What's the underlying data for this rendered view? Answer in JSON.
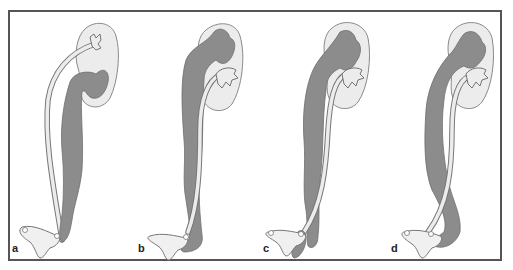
{
  "figure": {
    "type": "anatomical-diagram",
    "colors": {
      "frame": "#555555",
      "kidney_fill": "#ececec",
      "kidney_stroke": "#8a8a8a",
      "dilated_system": "#8c8c8c",
      "ureter_fill": "#e8e8e8",
      "outline": "#777777"
    },
    "panels": [
      {
        "id": "a",
        "label": "a"
      },
      {
        "id": "b",
        "label": "b"
      },
      {
        "id": "c",
        "label": "c"
      },
      {
        "id": "d",
        "label": "d"
      }
    ]
  }
}
